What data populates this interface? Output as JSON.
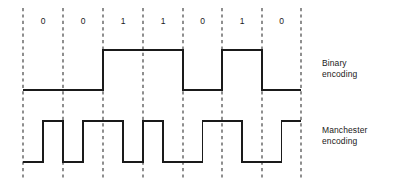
{
  "figure": {
    "title_present": false,
    "background_color": "#ffffff",
    "line_color": "#1a1a1a",
    "grid_color": "#333333"
  },
  "chart_data": {
    "type": "line",
    "title": "",
    "xlabel": "",
    "ylabel": "",
    "bits": [
      "0",
      "0",
      "1",
      "1",
      "0",
      "1",
      "0"
    ],
    "bit_count": 7,
    "gridline_count": 8,
    "gridline_x": [
      23,
      63,
      103,
      143,
      183,
      222,
      262,
      301
    ],
    "bit_cell_width": 39.7,
    "series": [
      {
        "name": "Binary encoding",
        "levels": [
          "low",
          "low",
          "high",
          "high",
          "low",
          "high",
          "low"
        ],
        "high_y": 50,
        "low_y": 90,
        "transitions_per_bit": 0
      },
      {
        "name": "Manchester encoding",
        "levels": [
          [
            "low",
            "high"
          ],
          [
            "low",
            "high"
          ],
          [
            "high",
            "low"
          ],
          [
            "high",
            "low"
          ],
          [
            "low",
            "high"
          ],
          [
            "high",
            "low"
          ],
          [
            "low",
            "high"
          ]
        ],
        "high_y": 121,
        "low_y": 162,
        "transitions_per_bit": 1,
        "convention": "0 = low-to-high mid-bit transition; 1 = high-to-low mid-bit transition"
      }
    ],
    "grid": true,
    "grid_style": "dashed-vertical",
    "legend_position": "right"
  },
  "labels": {
    "binary": {
      "line1": "Binary",
      "line2": "encoding"
    },
    "manchester": {
      "line1": "Manchester",
      "line2": "encoding"
    }
  }
}
